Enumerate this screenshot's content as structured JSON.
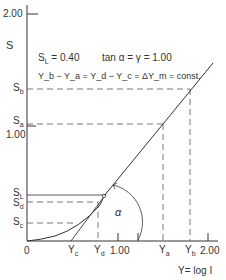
{
  "diagram": {
    "y_axis": {
      "label": "S",
      "ticks": [
        {
          "label": "2.00",
          "value": 2.0
        },
        {
          "label": "1.00",
          "value": 1.0
        }
      ]
    },
    "x_axis": {
      "label": "Y= log I",
      "ticks": [
        {
          "label": "0",
          "value": 0
        },
        {
          "label": "1.00",
          "value": 1.0
        },
        {
          "label": "2.00",
          "value": 2.0
        }
      ]
    },
    "annotations": {
      "line1_left": "S",
      "line1_left_sub": "L",
      "line1_left_rest": " = 0.40",
      "line1_right": "tan α = γ = 1.00",
      "line2": "Y_b − Y_a = Y_d − Y_c = ΔY_m = const."
    },
    "y_markers": [
      {
        "name": "S",
        "sub": "b"
      },
      {
        "name": "S",
        "sub": "a"
      },
      {
        "name": "S",
        "sub": "L"
      },
      {
        "name": "S",
        "sub": "d"
      },
      {
        "name": "S",
        "sub": "c"
      }
    ],
    "x_markers": [
      {
        "name": "Y",
        "sub": "c"
      },
      {
        "name": "Y",
        "sub": "d"
      },
      {
        "name": "Y",
        "sub": "a"
      },
      {
        "name": "Y",
        "sub": "b"
      }
    ],
    "angle_label": "α",
    "colors": {
      "line": "#333333",
      "dashed": "#555555",
      "background": "#ffffff"
    }
  }
}
